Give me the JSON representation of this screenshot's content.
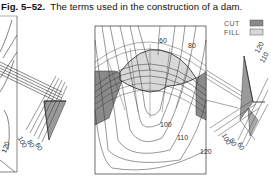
{
  "caption": {
    "number": "Fig. 5–52.",
    "text": "The terms used in the construction of a dam."
  },
  "legend": {
    "items": [
      {
        "label": "CUT",
        "color": "#8a8a8a"
      },
      {
        "label": "FILL",
        "color": "#d8d8d8"
      }
    ]
  },
  "left_panel": {
    "contour_labels": [
      "120"
    ],
    "section_labels": [
      "100",
      "80",
      "60"
    ]
  },
  "main_panel": {
    "contour_labels": [
      "60",
      "80",
      "100",
      "110",
      "120"
    ]
  },
  "right_section": {
    "labels": [
      "120",
      "110",
      "100",
      "80",
      "60"
    ]
  },
  "colors": {
    "line": "#333333",
    "cut": "#8a8a8a",
    "fill": "#d8d8d8",
    "background": "#ffffff"
  }
}
